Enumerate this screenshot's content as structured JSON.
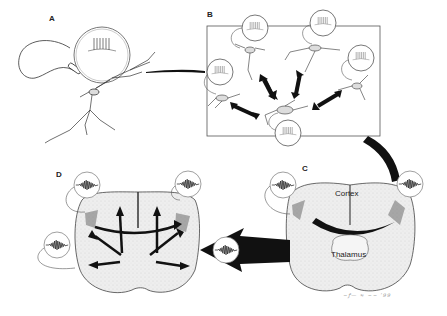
{
  "figure": {
    "panels": [
      {
        "id": "A",
        "label": "A",
        "description": "Single neuron with recording electrode and spike burst trace"
      },
      {
        "id": "B",
        "label": "B",
        "description": "Network of bursting neurons with reciprocal connections"
      },
      {
        "id": "C",
        "label": "C",
        "description": "Coronal brain section with cortico-thalamic loop"
      },
      {
        "id": "D",
        "label": "D",
        "description": "Coronal brain section with spreading activity arrows and oscillation traces"
      }
    ],
    "labels": {
      "cortex": "Cortex",
      "thalamus": "Thalamus"
    },
    "signature": "signature scribble",
    "colors": {
      "ink": "#1a1a1a",
      "tissue": "#ececec",
      "background": "#ffffff"
    }
  }
}
